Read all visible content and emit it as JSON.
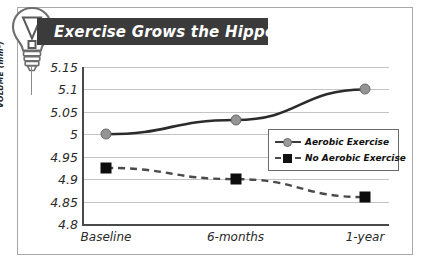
{
  "figure": {
    "icon": "lightbulb-idea-icon",
    "title": "Exercise Grows the Hippocampus",
    "banner_color": "#3b3b3b",
    "banner_text_color": "#ffffff",
    "border_color": "#a8a8a8"
  },
  "chart_data": {
    "type": "line",
    "title": "Exercise Grows the Hippocampus",
    "xlabel": "",
    "ylabel": "VOLUME (mm³)",
    "categories": [
      "Baseline",
      "6-months",
      "1-year"
    ],
    "series": [
      {
        "name": "Aerobic Exercise",
        "values": [
          5.0,
          5.032,
          5.1
        ],
        "color": "#949494",
        "line_color": "#2b2b2b",
        "line_style": "solid",
        "marker": "circle"
      },
      {
        "name": "No Aerobic Exercise",
        "values": [
          4.925,
          4.9,
          4.86
        ],
        "color": "#0d0d0d",
        "line_color": "#4a4a4a",
        "line_style": "dashed",
        "marker": "square"
      }
    ],
    "ylim": [
      4.8,
      5.15
    ],
    "yticks": [
      "5.15",
      "5.1",
      "5.05",
      "5",
      "4.95",
      "4.9",
      "4.85",
      "4.8"
    ],
    "ytick_values": [
      5.15,
      5.1,
      5.05,
      5.0,
      4.95,
      4.9,
      4.85,
      4.8
    ],
    "grid": true,
    "legend_position": "center-right"
  },
  "legend": {
    "entries": [
      {
        "label": "Aerobic Exercise",
        "marker": "circle",
        "style": "solid"
      },
      {
        "label": "No Aerobic Exercise",
        "marker": "square",
        "style": "dashed"
      }
    ]
  }
}
